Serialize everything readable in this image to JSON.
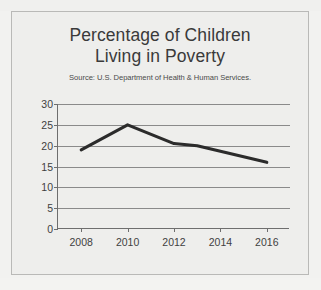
{
  "chart_data": {
    "type": "line",
    "title": "Percentage of Children Living in Poverty",
    "title_lines": [
      "Percentage of Children",
      "Living in Poverty"
    ],
    "subtitle": "Source: U.S. Department of Health & Human Services.",
    "xlabel": "",
    "ylabel": "",
    "x": [
      2008,
      2010,
      2012,
      2013,
      2016
    ],
    "values": [
      19,
      25,
      20.5,
      20,
      16
    ],
    "series": [
      {
        "name": "Percentage of children living in poverty",
        "points": [
          {
            "x": 2008,
            "y": 19
          },
          {
            "x": 2010,
            "y": 25
          },
          {
            "x": 2012,
            "y": 20.5
          },
          {
            "x": 2013,
            "y": 20
          },
          {
            "x": 2016,
            "y": 16
          }
        ]
      }
    ],
    "xlim": [
      2007,
      2017
    ],
    "ylim": [
      0,
      30
    ],
    "ytick_labels": [
      "30",
      "25",
      "20",
      "15",
      "10",
      "5",
      "0"
    ],
    "ytick_values": [
      30,
      25,
      20,
      15,
      10,
      5,
      0
    ],
    "xtick_labels": [
      "2008",
      "2010",
      "2012",
      "2014",
      "2016"
    ],
    "xtick_values": [
      2008,
      2010,
      2012,
      2014,
      2016
    ],
    "grid": "horizontal",
    "legend": "none",
    "line_color": "#2b2b2b",
    "background_color": "#eeeeec",
    "grid_color": "#8a8a8a",
    "axis_color": "#6e6e6e",
    "text_color": "#3a3a3a"
  }
}
